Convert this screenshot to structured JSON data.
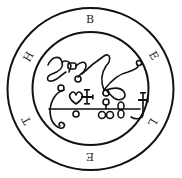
{
  "seal": {
    "name": "Seal of Beleth",
    "ring_letters": [
      "B",
      "E",
      "L",
      "E",
      "T",
      "H"
    ],
    "ink_color": "#111111",
    "background_color": "#ffffff"
  }
}
